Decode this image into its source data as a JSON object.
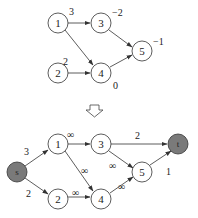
{
  "top_graph": {
    "nodes": [
      {
        "id": "1",
        "label": "1",
        "weight": "3"
      },
      {
        "id": "2",
        "label": "2",
        "weight": "2"
      },
      {
        "id": "3",
        "label": "3",
        "weight": "−2"
      },
      {
        "id": "4",
        "label": "4",
        "weight": "0"
      },
      {
        "id": "5",
        "label": "5",
        "weight": "−1"
      }
    ],
    "edges": [
      {
        "from": "1",
        "to": "3"
      },
      {
        "from": "1",
        "to": "4"
      },
      {
        "from": "2",
        "to": "4"
      },
      {
        "from": "3",
        "to": "5"
      },
      {
        "from": "4",
        "to": "5"
      }
    ]
  },
  "transform_arrow": "down-arrow",
  "bottom_graph": {
    "nodes": [
      {
        "id": "s",
        "label": "s",
        "fill": "#7a7a7a"
      },
      {
        "id": "1",
        "label": "1"
      },
      {
        "id": "2",
        "label": "2"
      },
      {
        "id": "3",
        "label": "3"
      },
      {
        "id": "4",
        "label": "4"
      },
      {
        "id": "5",
        "label": "5"
      },
      {
        "id": "t",
        "label": "t",
        "fill": "#7a7a7a"
      }
    ],
    "edges": [
      {
        "from": "s",
        "to": "1",
        "capacity": "3"
      },
      {
        "from": "s",
        "to": "2",
        "capacity": "2"
      },
      {
        "from": "1",
        "to": "3",
        "capacity": "∞"
      },
      {
        "from": "1",
        "to": "4",
        "capacity": "∞"
      },
      {
        "from": "2",
        "to": "4",
        "capacity": "∞"
      },
      {
        "from": "3",
        "to": "5",
        "capacity": "∞"
      },
      {
        "from": "4",
        "to": "5",
        "capacity": "∞"
      },
      {
        "from": "3",
        "to": "t",
        "capacity": "2"
      },
      {
        "from": "5",
        "to": "t",
        "capacity": "1"
      }
    ]
  },
  "colors": {
    "stroke": "#333333",
    "terminal_fill": "#7a7a7a",
    "node_fill": "#ffffff"
  }
}
